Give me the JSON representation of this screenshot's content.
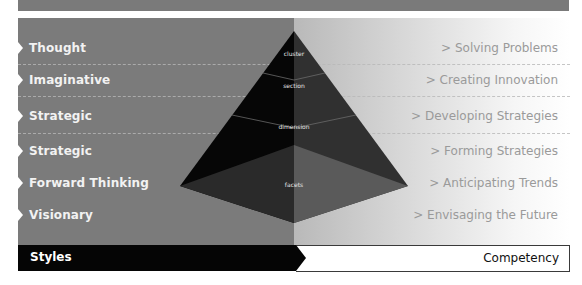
{
  "diagram": {
    "type": "pyramid-framework",
    "styles": [
      {
        "label": "Thought"
      },
      {
        "label": "Imaginative"
      },
      {
        "label": "Strategic"
      },
      {
        "label": "Strategic"
      },
      {
        "label": "Forward Thinking"
      },
      {
        "label": "Visionary"
      }
    ],
    "competencies": [
      {
        "label": "> Solving Problems"
      },
      {
        "label": "> Creating Innovation"
      },
      {
        "label": "> Developing Strategies"
      },
      {
        "label": "> Forming Strategies"
      },
      {
        "label": "> Anticipating Trends"
      },
      {
        "label": "> Envisaging the Future"
      }
    ],
    "pyramid_levels": {
      "cluster": "cluster",
      "section": "section",
      "dimension": "dimension",
      "facets": "facets"
    },
    "footer": {
      "left_label": "Styles",
      "right_label": "Competency"
    },
    "colors": {
      "left_panel": "#7b7b7b",
      "pyramid_dark": "#050505",
      "pyramid_mid": "#2e2e2e",
      "pyramid_base": "#4a4a4a",
      "footer_dark": "#050505"
    }
  }
}
